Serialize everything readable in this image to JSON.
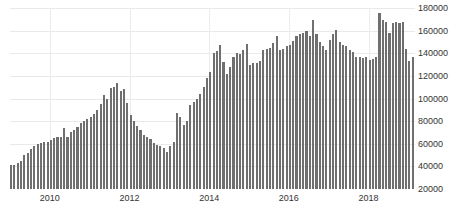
{
  "chart_data": {
    "type": "bar",
    "title": "",
    "subtitle": "",
    "xlabel": "",
    "ylabel": "",
    "ylim": [
      20000,
      180000
    ],
    "grid": true,
    "legend": null,
    "bar_color": "#6f6f6f",
    "background_color": "#ffffff",
    "gridline_color": "#e9e9e9",
    "y_ticks": [
      20000,
      40000,
      60000,
      80000,
      100000,
      120000,
      140000,
      160000,
      180000
    ],
    "y_tick_labels": [
      "20000",
      "40000",
      "60000",
      "80000",
      "100000",
      "120000",
      "140000",
      "160000",
      "180000"
    ],
    "y_axis_position": "right",
    "x_ticks": [
      "2010",
      "2012",
      "2014",
      "2016",
      "2018"
    ],
    "x_tick_labels": [
      "2010",
      "2012",
      "2014",
      "2016",
      "2018"
    ],
    "x_start": "2009-01",
    "x_end": "2019-02",
    "frequency": "monthly",
    "categories": [
      "2009-01",
      "2009-02",
      "2009-03",
      "2009-04",
      "2009-05",
      "2009-06",
      "2009-07",
      "2009-08",
      "2009-09",
      "2009-10",
      "2009-11",
      "2009-12",
      "2010-01",
      "2010-02",
      "2010-03",
      "2010-04",
      "2010-05",
      "2010-06",
      "2010-07",
      "2010-08",
      "2010-09",
      "2010-10",
      "2010-11",
      "2010-12",
      "2011-01",
      "2011-02",
      "2011-03",
      "2011-04",
      "2011-05",
      "2011-06",
      "2011-07",
      "2011-08",
      "2011-09",
      "2011-10",
      "2011-11",
      "2011-12",
      "2012-01",
      "2012-02",
      "2012-03",
      "2012-04",
      "2012-05",
      "2012-06",
      "2012-07",
      "2012-08",
      "2012-09",
      "2012-10",
      "2012-11",
      "2012-12",
      "2013-01",
      "2013-02",
      "2013-03",
      "2013-04",
      "2013-05",
      "2013-06",
      "2013-07",
      "2013-08",
      "2013-09",
      "2013-10",
      "2013-11",
      "2013-12",
      "2014-01",
      "2014-02",
      "2014-03",
      "2014-04",
      "2014-05",
      "2014-06",
      "2014-07",
      "2014-08",
      "2014-09",
      "2014-10",
      "2014-11",
      "2014-12",
      "2015-01",
      "2015-02",
      "2015-03",
      "2015-04",
      "2015-05",
      "2015-06",
      "2015-07",
      "2015-08",
      "2015-09",
      "2015-10",
      "2015-11",
      "2015-12",
      "2016-01",
      "2016-02",
      "2016-03",
      "2016-04",
      "2016-05",
      "2016-06",
      "2016-07",
      "2016-08",
      "2016-09",
      "2016-10",
      "2016-11",
      "2016-12",
      "2017-01",
      "2017-02",
      "2017-03",
      "2017-04",
      "2017-05",
      "2017-06",
      "2017-07",
      "2017-08",
      "2017-09",
      "2017-10",
      "2017-11",
      "2017-12",
      "2018-01",
      "2018-02",
      "2018-03",
      "2018-04",
      "2018-05",
      "2018-06",
      "2018-07",
      "2018-08",
      "2018-09",
      "2018-10",
      "2018-11",
      "2018-12",
      "2019-01",
      "2019-02"
    ],
    "values": [
      41000,
      41000,
      43000,
      45000,
      50000,
      52000,
      55000,
      58000,
      60000,
      61000,
      62000,
      62000,
      63000,
      65000,
      66000,
      66000,
      74000,
      66000,
      70000,
      72000,
      75000,
      78000,
      80000,
      82000,
      84000,
      86000,
      90000,
      95000,
      103000,
      100000,
      109000,
      110000,
      114000,
      107000,
      108000,
      96000,
      85000,
      80000,
      76000,
      72000,
      68000,
      66000,
      64000,
      61000,
      59000,
      58000,
      56000,
      53000,
      58000,
      62000,
      87000,
      84000,
      77000,
      80000,
      94000,
      97000,
      100000,
      104000,
      110000,
      118000,
      123000,
      140000,
      142000,
      147000,
      132000,
      122000,
      128000,
      137000,
      140000,
      139000,
      143000,
      148000,
      130000,
      131000,
      131000,
      133000,
      143000,
      144000,
      145000,
      149000,
      155000,
      143000,
      144000,
      146000,
      147000,
      151000,
      155000,
      157000,
      158000,
      160000,
      155000,
      169000,
      157000,
      150000,
      146000,
      143000,
      152000,
      157000,
      161000,
      150000,
      147000,
      146000,
      143000,
      141000,
      137000,
      137000,
      136000,
      137000,
      134000,
      135000,
      137000,
      176000,
      169000,
      168000,
      158000,
      167000,
      168000,
      167000,
      168000,
      144000,
      133000,
      137000
    ]
  }
}
